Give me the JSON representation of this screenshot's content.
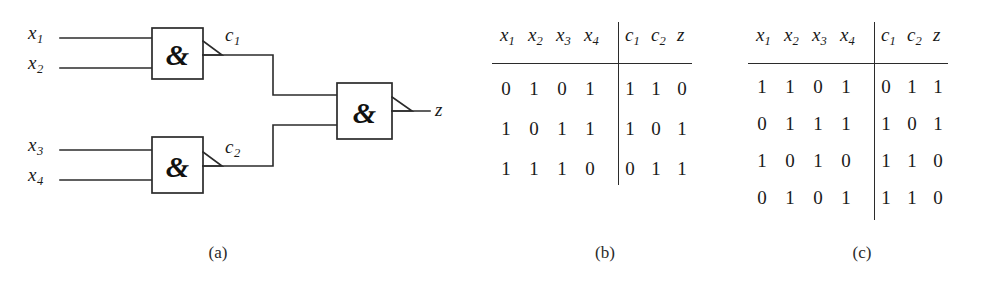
{
  "figure": {
    "panels": [
      {
        "id": "a",
        "caption": "(a)",
        "kind": "circuit"
      },
      {
        "id": "b",
        "caption": "(b)",
        "kind": "truth-table"
      },
      {
        "id": "c",
        "caption": "(c)",
        "kind": "truth-table"
      }
    ]
  },
  "circuit": {
    "inputs": [
      {
        "name": "x1",
        "base": "x",
        "sub": "1"
      },
      {
        "name": "x2",
        "base": "x",
        "sub": "2"
      },
      {
        "name": "x3",
        "base": "x",
        "sub": "3"
      },
      {
        "name": "x4",
        "base": "x",
        "sub": "4"
      }
    ],
    "internal_signals": [
      {
        "name": "c1",
        "base": "c",
        "sub": "1"
      },
      {
        "name": "c2",
        "base": "c",
        "sub": "2"
      }
    ],
    "output": {
      "name": "z",
      "base": "z",
      "sub": ""
    },
    "gates": [
      {
        "id": "g1",
        "symbol": "&",
        "type": "AND",
        "inputs": [
          "x1",
          "x2"
        ],
        "output": "c1"
      },
      {
        "id": "g2",
        "symbol": "&",
        "type": "AND",
        "inputs": [
          "x3",
          "x4"
        ],
        "output": "c2"
      },
      {
        "id": "g3",
        "symbol": "&",
        "type": "AND",
        "inputs": [
          "c1",
          "c2"
        ],
        "output": "z"
      }
    ],
    "colors": {
      "wire": "#2b2b2b",
      "box_fill": "#ffffff",
      "text": "#1a1a1a"
    }
  },
  "table_b": {
    "caption": "(b)",
    "input_headers": [
      {
        "base": "x",
        "sub": "1"
      },
      {
        "base": "x",
        "sub": "2"
      },
      {
        "base": "x",
        "sub": "3"
      },
      {
        "base": "x",
        "sub": "4"
      }
    ],
    "output_headers": [
      {
        "base": "c",
        "sub": "1"
      },
      {
        "base": "c",
        "sub": "2"
      },
      {
        "base": "z",
        "sub": ""
      }
    ],
    "rows": [
      {
        "inputs": [
          "0",
          "1",
          "0",
          "1"
        ],
        "outputs": [
          "1",
          "1",
          "0"
        ]
      },
      {
        "inputs": [
          "1",
          "0",
          "1",
          "1"
        ],
        "outputs": [
          "1",
          "0",
          "1"
        ]
      },
      {
        "inputs": [
          "1",
          "1",
          "1",
          "0"
        ],
        "outputs": [
          "0",
          "1",
          "1"
        ]
      }
    ]
  },
  "table_c": {
    "caption": "(c)",
    "input_headers": [
      {
        "base": "x",
        "sub": "1"
      },
      {
        "base": "x",
        "sub": "2"
      },
      {
        "base": "x",
        "sub": "3"
      },
      {
        "base": "x",
        "sub": "4"
      }
    ],
    "output_headers": [
      {
        "base": "c",
        "sub": "1"
      },
      {
        "base": "c",
        "sub": "2"
      },
      {
        "base": "z",
        "sub": ""
      }
    ],
    "rows": [
      {
        "inputs": [
          "1",
          "1",
          "0",
          "1"
        ],
        "outputs": [
          "0",
          "1",
          "1"
        ]
      },
      {
        "inputs": [
          "0",
          "1",
          "1",
          "1"
        ],
        "outputs": [
          "1",
          "0",
          "1"
        ]
      },
      {
        "inputs": [
          "1",
          "0",
          "1",
          "0"
        ],
        "outputs": [
          "1",
          "1",
          "0"
        ]
      },
      {
        "inputs": [
          "0",
          "1",
          "0",
          "1"
        ],
        "outputs": [
          "1",
          "1",
          "0"
        ]
      }
    ]
  }
}
